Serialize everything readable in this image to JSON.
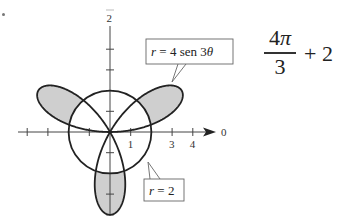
{
  "chart_data": {
    "type": "line",
    "subtype": "polar",
    "title": "",
    "origin_px": [
      110,
      132
    ],
    "scale_px_per_unit": 20.7,
    "axes": {
      "polar_axis_label": "0",
      "vertical_axis_label": "π/2",
      "vertical_axis_label_visible": "2",
      "x_tick_values": [
        -4,
        -3,
        -2,
        -1,
        1,
        2,
        3,
        4
      ],
      "x_tick_labels": [
        {
          "value": 1,
          "label": "1"
        },
        {
          "value": 3,
          "label": "3"
        },
        {
          "value": 4,
          "label": "4"
        }
      ],
      "y_tick_values": [
        -4,
        -3,
        -2,
        -1,
        1,
        2,
        3,
        4
      ]
    },
    "series": [
      {
        "name": "r = 4 sen 3θ",
        "equation": "r = 4 sin(3θ)",
        "kind": "rose",
        "petals": 3,
        "amplitude": 4,
        "k": 3,
        "stroke": "#222222"
      },
      {
        "name": "r = 2",
        "equation": "r = 2",
        "kind": "circle",
        "radius": 2,
        "stroke": "#222222"
      }
    ],
    "shaded_region": {
      "description": "Region inside the rose r = 4 sen 3θ and outside the circle r = 2",
      "fill": "#cfcfcf"
    },
    "annotations": [
      {
        "text_prefix": "r",
        "text_rest": " = 4 sen 3",
        "text_suffix": "θ",
        "box": [
          146,
          39,
          87,
          25
        ],
        "tail_to": [
          172,
          82
        ]
      },
      {
        "text_prefix": "r",
        "text_rest": " = 2",
        "box": [
          144,
          179,
          40,
          22
        ],
        "tail_to": [
          148,
          162
        ]
      }
    ]
  },
  "expression": {
    "numerator_digit": "4",
    "numerator_symbol": "π",
    "denominator": "3",
    "rest": "+ 2"
  }
}
